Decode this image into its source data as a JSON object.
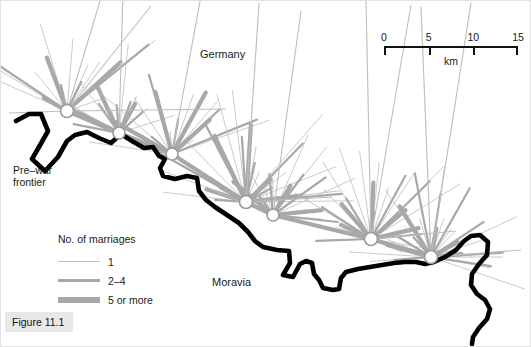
{
  "figure": {
    "caption": "Figure 11.1"
  },
  "labels": {
    "germany": "Germany",
    "moravia": "Moravia",
    "frontier": "Pre–war\nfrontier"
  },
  "scale": {
    "ticks": [
      "0",
      "5",
      "10",
      "15"
    ],
    "unit": "km",
    "max_km": 15
  },
  "legend": {
    "title": "No. of marriages",
    "items": [
      {
        "label": "1",
        "weight": "thin"
      },
      {
        "label": "2–4",
        "weight": "medium"
      },
      {
        "label": "5 or more",
        "weight": "thick"
      }
    ]
  },
  "colors": {
    "frontier": "#000000",
    "link_thin": "#bdbdbd",
    "link_medium": "#a8a8a8",
    "link_thick": "#a8a8a8",
    "node_fill": "#ffffff",
    "node_stroke": "#9a9a9a",
    "caption_bg": "#e8e8e8",
    "text": "#1a1a1a"
  },
  "chart_data": {
    "type": "map",
    "title": "Figure 11.1",
    "regions": [
      "Germany",
      "Moravia"
    ],
    "scale_km": [
      0,
      5,
      10,
      15
    ],
    "legend_classes": [
      "1",
      "2–4",
      "5 or more"
    ],
    "frontier_path": "M 15,120 L 28,113 L 40,113 L 47,130 L 38,146 L 31,158 L 44,170 L 57,156 L 66,140 L 74,134 L 86,131 L 98,137 L 110,142 L 120,133 L 131,140 L 143,147 L 152,146 L 158,155 L 164,158 L 159,167 L 162,175 L 174,178 L 186,175 L 196,177 L 198,190 L 205,199 L 214,206 L 226,214 L 238,222 L 247,231 L 254,240 L 262,246 L 276,249 L 288,250 L 289,262 L 282,274 L 292,276 L 299,263 L 305,260 L 311,262 L 313,273 L 318,279 L 322,287 L 332,289 L 338,288 L 340,277 L 345,271 L 357,268 L 369,266 L 381,264 L 393,262 L 404,261 L 415,261 L 424,263 L 433,261 L 444,256 L 455,249 L 463,240 L 470,235 L 479,234 L 487,241 L 486,254 L 478,263 L 471,273 L 470,284 L 476,293 L 484,299 L 489,308 L 486,318 L 478,327 L 472,336 L 471,343",
    "nodes": [
      {
        "id": "n1",
        "x": 66,
        "y": 110,
        "r": 6.5
      },
      {
        "id": "n2",
        "x": 118,
        "y": 132,
        "r": 6.0
      },
      {
        "id": "n3",
        "x": 171,
        "y": 153,
        "r": 6.0
      },
      {
        "id": "n4",
        "x": 245,
        "y": 201,
        "r": 6.5
      },
      {
        "id": "n5",
        "x": 272,
        "y": 214,
        "r": 6.0
      },
      {
        "id": "n6",
        "x": 370,
        "y": 238,
        "r": 6.5
      },
      {
        "id": "n7",
        "x": 430,
        "y": 256,
        "r": 6.5
      }
    ]
  }
}
